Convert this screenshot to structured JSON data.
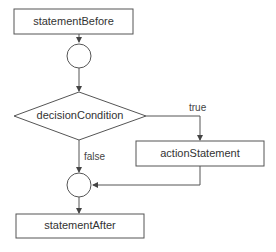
{
  "diagram": {
    "nodes": {
      "statement_before": "statementBefore",
      "decision": "decisionCondition",
      "action": "actionStatement",
      "statement_after": "statementAfter"
    },
    "edge_labels": {
      "true_label": "true",
      "false_label": "false"
    },
    "colors": {
      "stroke": "#555555",
      "background": "#ffffff"
    }
  }
}
